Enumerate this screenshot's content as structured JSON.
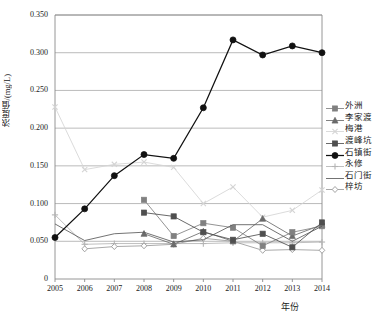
{
  "chart_data": {
    "type": "line",
    "title": "",
    "xlabel": "年份",
    "ylabel": "浓度值/(mg/L)",
    "x": [
      2005,
      2006,
      2007,
      2008,
      2009,
      2010,
      2011,
      2012,
      2013,
      2014
    ],
    "xticklabels": [
      "2005",
      "2006",
      "2007",
      "2008",
      "2009",
      "2010",
      "2011",
      "2012",
      "2013",
      "2014"
    ],
    "yticklabels": [
      "0",
      "0.050",
      "0.100",
      "0.150",
      "0.200",
      "0.250",
      "0.300",
      "0.350"
    ],
    "ytickvalues": [
      0,
      0.05,
      0.1,
      0.15,
      0.2,
      0.25,
      0.3,
      0.35
    ],
    "ylim": [
      0,
      0.35
    ],
    "xlim": [
      2005,
      2014
    ],
    "grid": "horizontal",
    "legend_position": "right",
    "series": [
      {
        "name": "外洲",
        "marker": "square",
        "color": "#808080",
        "values": [
          null,
          null,
          null,
          0.105,
          0.057,
          0.074,
          0.068,
          0.044,
          0.062,
          0.07
        ]
      },
      {
        "name": "李家渡",
        "marker": "triangle",
        "color": "#6b6b6b",
        "values": [
          null,
          null,
          null,
          0.06,
          0.046,
          0.063,
          0.05,
          0.08,
          0.057,
          0.072
        ]
      },
      {
        "name": "梅港",
        "marker": "x",
        "color": "#d4d4d4",
        "values": [
          0.228,
          0.145,
          0.152,
          0.155,
          0.148,
          0.1,
          0.122,
          0.082,
          0.091,
          0.118
        ]
      },
      {
        "name": "渡峰坑",
        "marker": "square",
        "color": "#4f4f4f",
        "values": [
          null,
          null,
          null,
          0.088,
          0.083,
          0.062,
          0.052,
          0.06,
          0.042,
          0.075
        ]
      },
      {
        "name": "石镇街",
        "marker": "circle-filled",
        "color": "#111111",
        "values": [
          0.055,
          0.093,
          0.137,
          0.165,
          0.16,
          0.227,
          0.317,
          0.297,
          0.309,
          0.3
        ]
      },
      {
        "name": "永修",
        "marker": "plus",
        "color": "#b4b4b4",
        "values": [
          0.085,
          0.046,
          0.047,
          0.047,
          0.047,
          0.047,
          0.048,
          0.048,
          0.048,
          0.049
        ]
      },
      {
        "name": "石门街",
        "marker": "none",
        "color": "#5a5a5a",
        "values": [
          0.073,
          0.051,
          0.06,
          0.062,
          0.049,
          0.052,
          0.072,
          0.072,
          0.05,
          0.07
        ]
      },
      {
        "name": "梓坊",
        "marker": "diamond",
        "color": "#9a9a9a",
        "values": [
          null,
          0.04,
          0.043,
          0.044,
          0.046,
          0.054,
          0.05,
          0.038,
          0.039,
          0.038
        ]
      }
    ]
  },
  "legend": {
    "items": [
      {
        "label": "外洲"
      },
      {
        "label": "李家渡"
      },
      {
        "label": "梅港"
      },
      {
        "label": "渡峰坑"
      },
      {
        "label": "石镇街"
      },
      {
        "label": "永修"
      },
      {
        "label": "石门街"
      },
      {
        "label": "梓坊"
      }
    ]
  }
}
